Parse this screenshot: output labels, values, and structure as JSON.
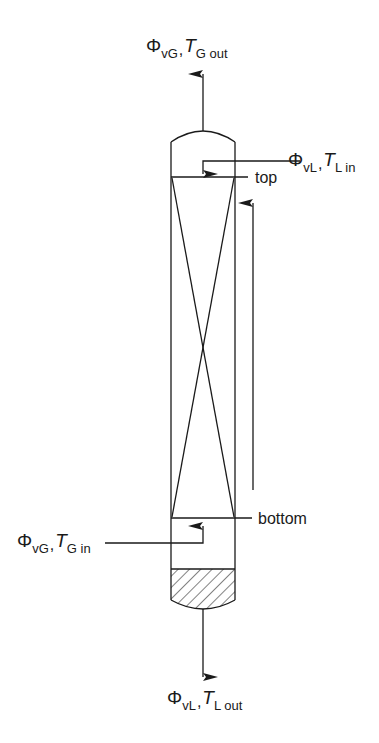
{
  "figure": {
    "type": "packed column schematic",
    "colors": {
      "line": "#1a1a1a",
      "background": "#ffffff"
    }
  },
  "labels": {
    "gas_out": {
      "symbol": "Φ",
      "flow_sub": "vG",
      "separator": ",",
      "temp_symbol": "T",
      "temp_sub": "G out"
    },
    "liquid_in": {
      "symbol": "Φ",
      "flow_sub": "vL",
      "separator": ",",
      "temp_symbol": "T",
      "temp_sub": "L in"
    },
    "gas_in": {
      "symbol": "Φ",
      "flow_sub": "vG",
      "separator": ",",
      "temp_symbol": "T",
      "temp_sub": "G in"
    },
    "liquid_out": {
      "symbol": "Φ",
      "flow_sub": "vL",
      "separator": ",",
      "temp_symbol": "T",
      "temp_sub": "L out"
    },
    "top": "top",
    "bottom": "bottom"
  }
}
